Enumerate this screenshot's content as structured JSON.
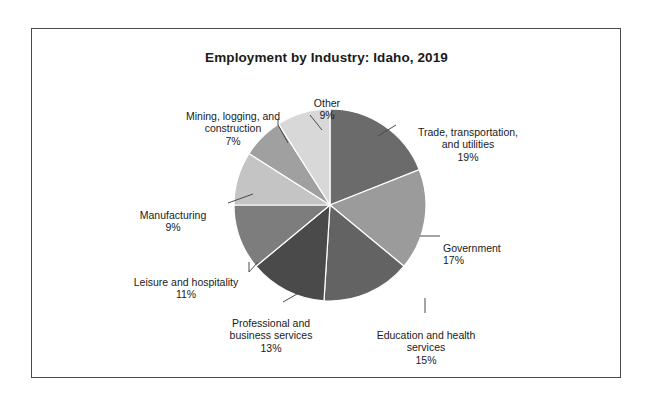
{
  "chart_data": {
    "type": "pie",
    "title": "Employment by Industry: Idaho, 2019",
    "xlabel": "",
    "ylabel": "",
    "legend_position": "none",
    "labels_outside": true,
    "start_angle_deg": 0,
    "direction": "clockwise",
    "categories": [
      "Trade, transportation, and utilities",
      "Government",
      "Education and health services",
      "Professional and business services",
      "Leisure and hospitality",
      "Manufacturing",
      "Mining, logging, and construction",
      "Other"
    ],
    "values": [
      19,
      17,
      15,
      13,
      11,
      9,
      7,
      9
    ],
    "value_unit": "%",
    "colors": [
      "#6b6b6b",
      "#9b9b9b",
      "#636363",
      "#4a4a4a",
      "#7d7d7d",
      "#c4c4c4",
      "#a0a0a0",
      "#d8d8d8"
    ]
  },
  "figure": {
    "title": "Employment by Industry: Idaho, 2019",
    "border_color": "#4a4a4a",
    "background": "#ffffff"
  },
  "labels": {
    "trade": {
      "name": "Trade, transportation,\nand utilities",
      "pct": "19%"
    },
    "government": {
      "name": "Government",
      "pct": "17%"
    },
    "education": {
      "name": "Education and health\nservices",
      "pct": "15%"
    },
    "profbus": {
      "name": "Professional and\nbusiness services",
      "pct": "13%"
    },
    "leisure": {
      "name": "Leisure and hospitality",
      "pct": "11%"
    },
    "manufact": {
      "name": "Manufacturing",
      "pct": "9%"
    },
    "mining": {
      "name": "Mining, logging, and\nconstruction",
      "pct": "7%"
    },
    "other": {
      "name": "Other",
      "pct": "9%"
    }
  }
}
